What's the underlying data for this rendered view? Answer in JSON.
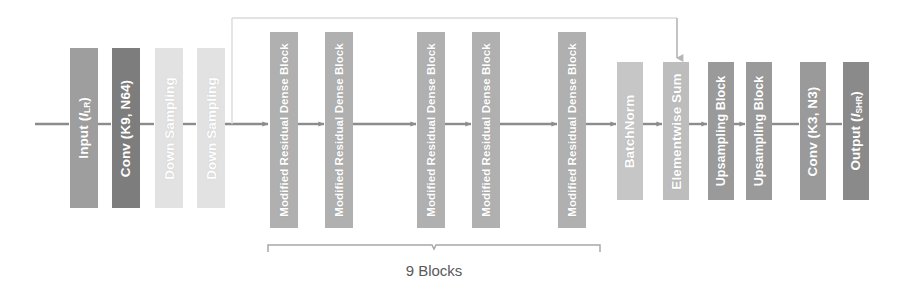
{
  "figure": {
    "type": "neural-network-architecture-diagram",
    "title": "",
    "background_color": "#ffffff",
    "width": 898,
    "height": 308
  },
  "flow": {
    "direction": "left-to-right",
    "line_color": "#8c8c8c",
    "baseline_y": 124
  },
  "blocks": [
    {
      "id": "input",
      "label": "Input (I",
      "label_sub": "LR",
      "label_tail": ")",
      "full_text": "Input (ILR)",
      "color": "#9e9e9e",
      "x": 70,
      "y": 48,
      "w": 28,
      "h": 160
    },
    {
      "id": "conv-k9-n64",
      "label": "Conv (K9, N64)",
      "label_sub": "",
      "label_tail": "",
      "full_text": "Conv (K9, N64)",
      "color": "#7d7d7d",
      "x": 112,
      "y": 48,
      "w": 28,
      "h": 160
    },
    {
      "id": "down-sampling-1",
      "label": "Down Sampling",
      "label_sub": "",
      "label_tail": "",
      "full_text": "Down Sampling",
      "color": "#e2e2e2",
      "x": 155,
      "y": 48,
      "w": 28,
      "h": 160
    },
    {
      "id": "down-sampling-2",
      "label": "Down Sampling",
      "label_sub": "",
      "label_tail": "",
      "full_text": "Down Sampling",
      "color": "#e2e2e2",
      "x": 197,
      "y": 48,
      "w": 28,
      "h": 160
    },
    {
      "id": "mrdb-1",
      "label": "Modified Residual Dense Block",
      "label_sub": "",
      "label_tail": "",
      "full_text": "Modified Residual Dense Block",
      "color": "#b0b0b0",
      "x": 270,
      "y": 32,
      "w": 28,
      "h": 196
    },
    {
      "id": "mrdb-2",
      "label": "Modified Residual Dense Block",
      "label_sub": "",
      "label_tail": "",
      "full_text": "Modified Residual Dense Block",
      "color": "#b0b0b0",
      "x": 325,
      "y": 32,
      "w": 28,
      "h": 196
    },
    {
      "id": "mrdb-3",
      "label": "Modified Residual Dense Block",
      "label_sub": "",
      "label_tail": "",
      "full_text": "Modified Residual Dense Block",
      "color": "#b0b0b0",
      "x": 417,
      "y": 32,
      "w": 28,
      "h": 196
    },
    {
      "id": "mrdb-4",
      "label": "Modified Residual Dense Block",
      "label_sub": "",
      "label_tail": "",
      "full_text": "Modified Residual Dense Block",
      "color": "#b0b0b0",
      "x": 472,
      "y": 32,
      "w": 28,
      "h": 196
    },
    {
      "id": "mrdb-5",
      "label": "Modified Residual Dense Block",
      "label_sub": "",
      "label_tail": "",
      "full_text": "Modified Residual Dense Block",
      "color": "#b0b0b0",
      "x": 558,
      "y": 32,
      "w": 28,
      "h": 196
    },
    {
      "id": "batchnorm",
      "label": "BatchNorm",
      "label_sub": "",
      "label_tail": "",
      "full_text": "BatchNorm",
      "color": "#c6c6c6",
      "x": 617,
      "y": 62,
      "w": 26,
      "h": 138
    },
    {
      "id": "elementwise-sum",
      "label": "Elementwise Sum",
      "label_sub": "",
      "label_tail": "",
      "full_text": "Elementwise Sum",
      "color": "#bdbdbd",
      "x": 663,
      "y": 62,
      "w": 26,
      "h": 138
    },
    {
      "id": "upsampling-block-1",
      "label": "Upsampling Block",
      "label_sub": "",
      "label_tail": "",
      "full_text": "Upsampling Block",
      "color": "#9a9a9a",
      "x": 708,
      "y": 62,
      "w": 26,
      "h": 138
    },
    {
      "id": "upsampling-block-2",
      "label": "Upsampling Block",
      "label_sub": "",
      "label_tail": "",
      "full_text": "Upsampling Block",
      "color": "#9a9a9a",
      "x": 746,
      "y": 62,
      "w": 26,
      "h": 138
    },
    {
      "id": "conv-k3-n3",
      "label": "Conv (K3, N3)",
      "label_sub": "",
      "label_tail": "",
      "full_text": "Conv (K3, N3)",
      "color": "#9a9a9a",
      "x": 800,
      "y": 62,
      "w": 26,
      "h": 138
    },
    {
      "id": "output",
      "label": "Output (I",
      "label_sub": "SHR",
      "label_tail": ")",
      "full_text": "Output (ISHR)",
      "color": "#8a8a8a",
      "x": 843,
      "y": 62,
      "w": 26,
      "h": 138
    }
  ],
  "brace": {
    "label": "9 Blocks",
    "x_start": 268,
    "x_end": 600,
    "y": 245,
    "label_y": 262,
    "color": "#9a9a9a"
  },
  "skip_connection": {
    "description": "skip connection from early feature map down into Elementwise Sum",
    "arrow_x": 677,
    "arrow_y_start": 18,
    "arrow_y_end": 60,
    "color": "#b5b5b5"
  }
}
